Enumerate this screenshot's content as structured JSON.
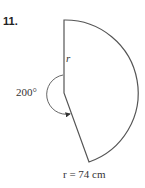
{
  "problem": {
    "number": "11."
  },
  "figure": {
    "type": "circular sector",
    "central_angle_label": "200°",
    "radius_symbol": "r",
    "caption": "r = 74 cm",
    "colors": {
      "stroke": "#555555",
      "fill": "#ffffff"
    }
  }
}
